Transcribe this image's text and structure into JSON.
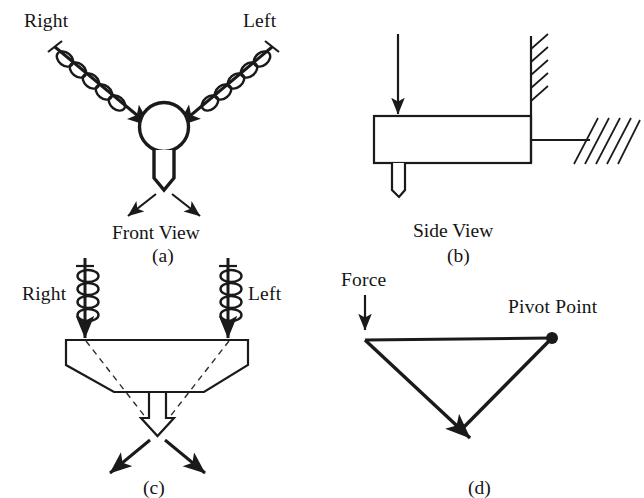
{
  "figure": {
    "background_color": "#ffffff",
    "line_color": "#1a1a1a",
    "panels": [
      {
        "id": "a",
        "caption": "(a)",
        "view_label": "Front View",
        "labels": [
          "Right",
          "Left"
        ],
        "description": "Two coil-spring loaded arrows angled inward toward a circular hub with a downward chisel pin and two diverging reaction arrows",
        "elements": {
          "left_input_label": "Right",
          "right_input_label": "Left",
          "hub_shape": "circle",
          "pin_shape": "chisel-pin",
          "reaction_arrows": 2
        }
      },
      {
        "id": "b",
        "caption": "(b)",
        "view_label": "Side View",
        "labels": [],
        "description": "A downward force arrow onto a rectangular bar fixed to a hatched wall on the right, with a blade below the bar",
        "elements": {
          "force_arrows": 1,
          "body_shape": "rectangle",
          "supports": [
            "hatched-wall-vertical",
            "hatched-ground-angled"
          ],
          "blade_shape": "blade"
        }
      },
      {
        "id": "c",
        "caption": "(c)",
        "view_label": "",
        "labels": [
          "Right",
          "Left"
        ],
        "description": "Two vertical coil-spring arrows pressing down on a chamfered block whose dashed internal lines converge to a hollow downward arrow tip with two diverging reaction arrows",
        "elements": {
          "left_input_label": "Right",
          "right_input_label": "Left",
          "body_shape": "chamfered-block",
          "internal_lines": "dashed",
          "tip_shape": "hollow-arrow",
          "reaction_arrows": 2
        }
      },
      {
        "id": "d",
        "caption": "(d)",
        "view_label": "",
        "labels": [
          "Force",
          "Pivot Point"
        ],
        "description": "Force vector diagram: a downward force at the left vertex, a horizontal member to a solid pivot point at the right, and a resultant arrow pointing down-left",
        "elements": {
          "force_label": "Force",
          "pivot_label": "Pivot Point",
          "pivot_marker": "filled-dot",
          "vectors": 3
        }
      }
    ]
  }
}
